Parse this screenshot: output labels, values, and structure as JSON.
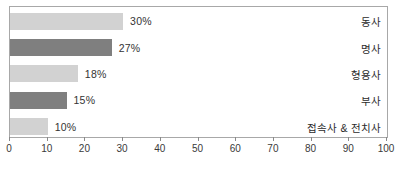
{
  "chart_data": {
    "type": "bar",
    "orientation": "horizontal",
    "title": "",
    "subtitle": "",
    "xlabel": "",
    "ylabel": "",
    "xlim": [
      0,
      100
    ],
    "grid": false,
    "legend": "none",
    "x_ticks": [
      "0",
      "10",
      "20",
      "30",
      "40",
      "50",
      "60",
      "70",
      "80",
      "90",
      "100"
    ],
    "x_tick_values": [
      0,
      10,
      20,
      30,
      40,
      50,
      60,
      70,
      80,
      90,
      100
    ],
    "categories": [
      "동사",
      "명사",
      "형용사",
      "부사",
      "접속사 & 전치사"
    ],
    "values": [
      30,
      27,
      18,
      15,
      10
    ],
    "data_labels": [
      "30%",
      "27%",
      "18%",
      "15%",
      "10%"
    ],
    "bar_colors": [
      "#d2d2d2",
      "#7f7f7f",
      "#d2d2d2",
      "#7f7f7f",
      "#d2d2d2"
    ],
    "colors": {
      "light_bar": "#d2d2d2",
      "dark_bar": "#7f7f7f",
      "frame": "#a8a8a8",
      "text": "#333333",
      "background": "#ffffff"
    }
  }
}
